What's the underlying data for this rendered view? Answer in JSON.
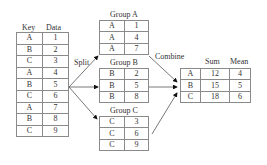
{
  "source_table": {
    "headers": [
      "Key",
      "Data"
    ],
    "rows": [
      [
        "A",
        "1"
      ],
      [
        "B",
        "2"
      ],
      [
        "C",
        "3"
      ],
      [
        "A",
        "4"
      ],
      [
        "B",
        "5"
      ],
      [
        "C",
        "6"
      ],
      [
        "A",
        "7"
      ],
      [
        "B",
        "8"
      ],
      [
        "C",
        "9"
      ]
    ]
  },
  "split_label": "Split",
  "combine_label": "Combine",
  "groups": [
    {
      "title": "Group A",
      "rows": [
        [
          "A",
          "1"
        ],
        [
          "A",
          "4"
        ],
        [
          "A",
          "7"
        ]
      ]
    },
    {
      "title": "Group B",
      "rows": [
        [
          "B",
          "2"
        ],
        [
          "B",
          "5"
        ],
        [
          "B",
          "8"
        ]
      ]
    },
    {
      "title": "Group C",
      "rows": [
        [
          "C",
          "3"
        ],
        [
          "C",
          "6"
        ],
        [
          "C",
          "9"
        ]
      ]
    }
  ],
  "result_table": {
    "headers": [
      "Sum",
      "Mean"
    ],
    "rows": [
      [
        "A",
        "12",
        "4"
      ],
      [
        "B",
        "15",
        "5"
      ],
      [
        "C",
        "18",
        "6"
      ]
    ]
  },
  "colors": {
    "border": "#8a8a8a",
    "arrow": "#555555",
    "arrowhead": "#111111"
  }
}
